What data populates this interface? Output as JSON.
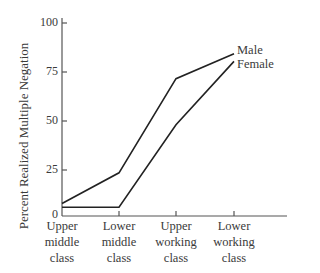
{
  "chart_data": {
    "type": "line",
    "title": "",
    "xlabel": "",
    "ylabel": "Percent Realized Multiple Negation",
    "ylim": [
      0,
      100
    ],
    "yticks": [
      0,
      25,
      50,
      75,
      100
    ],
    "grid": false,
    "legend_position": "inline-right",
    "categories": [
      "Upper middle class",
      "Lower middle class",
      "Upper working class",
      "Lower working class"
    ],
    "category_lines": [
      [
        "Upper",
        "middle",
        "class"
      ],
      [
        "Lower",
        "middle",
        "class"
      ],
      [
        "Upper",
        "working",
        "class"
      ],
      [
        "Lower",
        "working",
        "class"
      ]
    ],
    "series": [
      {
        "name": "Male",
        "values": [
          6,
          22,
          71,
          84
        ]
      },
      {
        "name": "Female",
        "values": [
          4,
          4,
          47,
          80
        ]
      }
    ]
  },
  "labels": {
    "ylabel": "Percent Realized Multiple Negation",
    "male": "Male",
    "female": "Female",
    "tick_0": "0",
    "tick_25": "25",
    "tick_50": "50",
    "tick_75": "75",
    "tick_100": "100",
    "cat0_l1": "Upper",
    "cat0_l2": "middle",
    "cat0_l3": "class",
    "cat1_l1": "Lower",
    "cat1_l2": "middle",
    "cat1_l3": "class",
    "cat2_l1": "Upper",
    "cat2_l2": "working",
    "cat2_l3": "class",
    "cat3_l1": "Lower",
    "cat3_l2": "working",
    "cat3_l3": "class"
  }
}
